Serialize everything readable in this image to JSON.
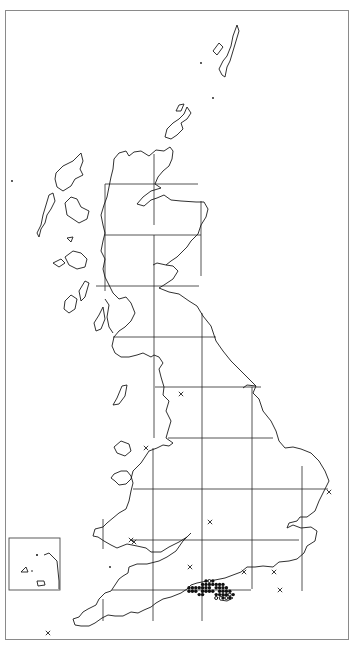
{
  "map": {
    "title": "",
    "region": "Great Britain",
    "grid": "100 km national grid",
    "inset": "Channel Islands",
    "colors": {
      "coast": "#1a1a1a",
      "grid": "#2a2a2a",
      "frame": "#8a8a8a",
      "marker": "#111111",
      "background": "#ffffff"
    }
  },
  "legend": {
    "symbols": [
      {
        "symbol": "filled-circle",
        "meaning": "recorded (recent)"
      },
      {
        "symbol": "open-circle",
        "meaning": "recorded (older)"
      },
      {
        "symbol": "cross",
        "meaning": "introduced / casual record"
      }
    ]
  },
  "records": {
    "filled": [
      [
        0,
        2
      ],
      [
        1,
        2
      ],
      [
        2,
        2
      ],
      [
        3,
        2
      ],
      [
        4,
        2
      ],
      [
        5,
        2
      ],
      [
        6,
        2
      ],
      [
        0,
        3
      ],
      [
        1,
        3
      ],
      [
        2,
        3
      ],
      [
        4,
        3
      ],
      [
        5,
        3
      ],
      [
        6,
        3
      ],
      [
        7,
        3
      ],
      [
        4,
        1
      ],
      [
        5,
        1
      ],
      [
        6,
        1
      ],
      [
        7,
        1
      ],
      [
        8,
        1
      ],
      [
        9,
        1
      ],
      [
        10,
        1
      ],
      [
        5,
        0
      ],
      [
        7,
        0
      ],
      [
        3,
        4
      ],
      [
        4,
        4
      ],
      [
        8,
        4
      ],
      [
        9,
        4
      ],
      [
        10,
        4
      ],
      [
        11,
        4
      ],
      [
        8,
        2
      ],
      [
        9,
        2
      ],
      [
        10,
        2
      ],
      [
        11,
        2
      ],
      [
        9,
        3
      ],
      [
        10,
        3
      ],
      [
        11,
        3
      ],
      [
        12,
        3
      ],
      [
        10,
        5
      ],
      [
        12,
        5
      ],
      [
        13,
        4
      ]
    ],
    "open": [
      [
        6,
        0
      ],
      [
        8,
        5
      ],
      [
        11,
        5
      ],
      [
        12,
        4
      ]
    ],
    "crosses": [
      {
        "id": "lancashire"
      },
      {
        "id": "north-wales"
      },
      {
        "id": "norfolk"
      },
      {
        "id": "south-wales"
      },
      {
        "id": "midlands"
      },
      {
        "id": "somerset"
      },
      {
        "id": "surrey"
      },
      {
        "id": "kent"
      },
      {
        "id": "sussex-coast"
      },
      {
        "id": "scilly"
      },
      {
        "id": "dorset-coast"
      }
    ]
  }
}
